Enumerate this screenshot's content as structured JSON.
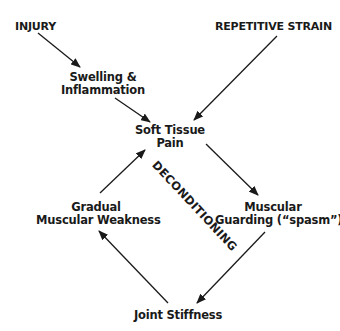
{
  "diagram": {
    "type": "flowchart-cycle",
    "nodes": {
      "injury": {
        "label": "INJURY"
      },
      "repetitive_strain": {
        "label": "REPETITIVE STRAIN"
      },
      "swelling": {
        "line1": "Swelling &",
        "line2": "Inflammation"
      },
      "soft_tissue_pain": {
        "line1": "Soft Tissue",
        "line2": "Pain"
      },
      "gradual_weakness": {
        "line1": "Gradual",
        "line2": "Muscular Weakness"
      },
      "muscular_guarding": {
        "line1": "Muscular",
        "line2": "Guarding (“spasm”)"
      },
      "joint_stiffness": {
        "label": "Joint Stiffness"
      }
    },
    "cycle_label": "DECONDITIONING",
    "edges": [
      {
        "from": "INJURY",
        "to": "Swelling & Inflammation"
      },
      {
        "from": "Swelling & Inflammation",
        "to": "Soft Tissue Pain"
      },
      {
        "from": "REPETITIVE STRAIN",
        "to": "Soft Tissue Pain"
      },
      {
        "from": "Soft Tissue Pain",
        "to": "Muscular Guarding (“spasm”)"
      },
      {
        "from": "Muscular Guarding (“spasm”)",
        "to": "Joint Stiffness"
      },
      {
        "from": "Joint Stiffness",
        "to": "Gradual Muscular Weakness"
      },
      {
        "from": "Gradual Muscular Weakness",
        "to": "Soft Tissue Pain"
      }
    ],
    "colors": {
      "text": "#1a1a1a",
      "arrow": "#1a1a1a",
      "background": "#ffffff"
    }
  }
}
